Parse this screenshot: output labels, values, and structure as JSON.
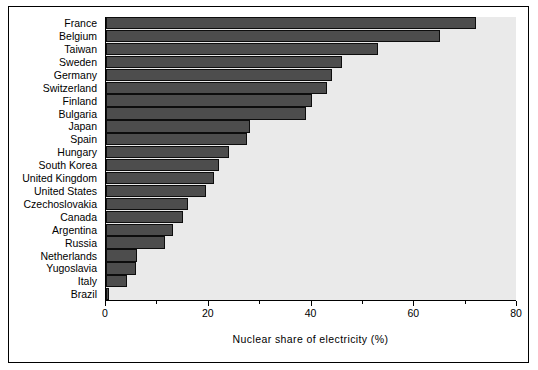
{
  "chart_data": {
    "type": "bar",
    "orientation": "horizontal",
    "title": "",
    "xlabel": "Nuclear share of electricity (%)",
    "ylabel": "",
    "xlim": [
      0,
      80
    ],
    "xticks": [
      0,
      20,
      40,
      60,
      80
    ],
    "xticklabels": [
      "0",
      "20",
      "40",
      "60",
      "80"
    ],
    "minor_xticks": [
      10,
      30,
      50,
      70
    ],
    "grid": false,
    "legend": null,
    "bar_color": "#4d4d4d",
    "bar_edge_color": "#0d0d0d",
    "plot_background": "#eaeaea",
    "categories": [
      "France",
      "Belgium",
      "Taiwan",
      "Sweden",
      "Germany",
      "Switzerland",
      "Finland",
      "Bulgaria",
      "Japan",
      "Spain",
      "Hungary",
      "South Korea",
      "United Kingdom",
      "United States",
      "Czechoslovakia",
      "Canada",
      "Argentina",
      "Russia",
      "Netherlands",
      "Yugoslavia",
      "Italy",
      "Brazil"
    ],
    "values": [
      72.0,
      65.0,
      53.0,
      46.0,
      44.0,
      43.0,
      40.0,
      39.0,
      28.0,
      27.5,
      24.0,
      22.0,
      21.0,
      19.5,
      16.0,
      15.0,
      13.0,
      11.5,
      6.0,
      5.8,
      4.0,
      0.6
    ],
    "series": [
      {
        "name": "Nuclear share of electricity (%)",
        "points": [
          {
            "category": "France",
            "value": 72.0
          },
          {
            "category": "Belgium",
            "value": 65.0
          },
          {
            "category": "Taiwan",
            "value": 53.0
          },
          {
            "category": "Sweden",
            "value": 46.0
          },
          {
            "category": "Germany",
            "value": 44.0
          },
          {
            "category": "Switzerland",
            "value": 43.0
          },
          {
            "category": "Finland",
            "value": 40.0
          },
          {
            "category": "Bulgaria",
            "value": 39.0
          },
          {
            "category": "Japan",
            "value": 28.0
          },
          {
            "category": "Spain",
            "value": 27.5
          },
          {
            "category": "Hungary",
            "value": 24.0
          },
          {
            "category": "South Korea",
            "value": 22.0
          },
          {
            "category": "United Kingdom",
            "value": 21.0
          },
          {
            "category": "United States",
            "value": 19.5
          },
          {
            "category": "Czechoslovakia",
            "value": 16.0
          },
          {
            "category": "Canada",
            "value": 15.0
          },
          {
            "category": "Argentina",
            "value": 13.0
          },
          {
            "category": "Russia",
            "value": 11.5
          },
          {
            "category": "Netherlands",
            "value": 6.0
          },
          {
            "category": "Yugoslavia",
            "value": 5.8
          },
          {
            "category": "Italy",
            "value": 4.0
          },
          {
            "category": "Brazil",
            "value": 0.6
          }
        ]
      }
    ]
  }
}
